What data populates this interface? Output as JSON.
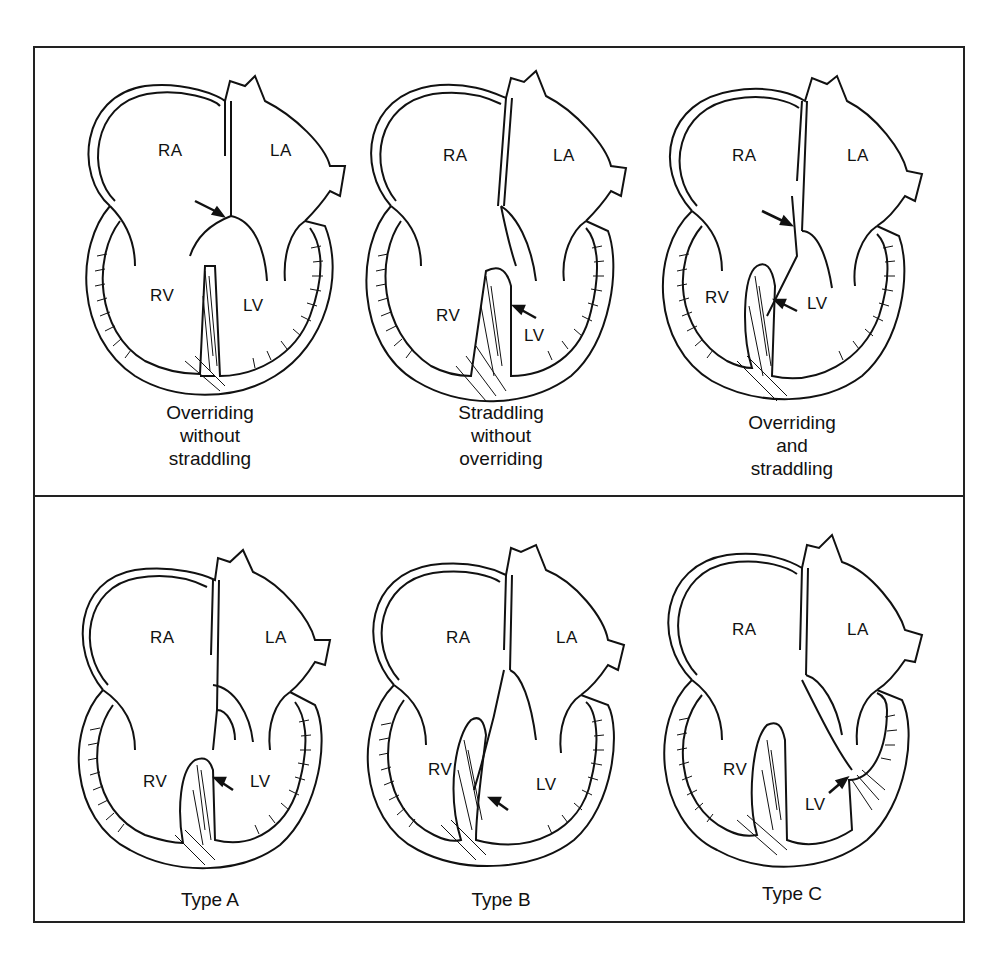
{
  "figure": {
    "rows": [
      {
        "panels": [
          {
            "caption": "Overriding\nwithout\nstraddling",
            "labels": {
              "ra": "RA",
              "la": "LA",
              "rv": "RV",
              "lv": "LV"
            },
            "arrows": 1,
            "arrow_targets": [
              "atrial septum / valve annulus overriding"
            ]
          },
          {
            "caption": "Straddling\nwithout\noverriding",
            "labels": {
              "ra": "RA",
              "la": "LA",
              "rv": "RV",
              "lv": "LV"
            },
            "arrows": 1,
            "arrow_targets": [
              "chordae straddling septal crest"
            ]
          },
          {
            "caption": "Overriding\nand\nstraddling",
            "labels": {
              "ra": "RA",
              "la": "LA",
              "rv": "RV",
              "lv": "LV"
            },
            "arrows": 2,
            "arrow_targets": [
              "overriding annulus",
              "straddling chordae"
            ]
          }
        ]
      },
      {
        "panels": [
          {
            "caption": "Type A",
            "labels": {
              "ra": "RA",
              "la": "LA",
              "rv": "RV",
              "lv": "LV"
            },
            "arrows": 1,
            "arrow_targets": [
              "chordae insertion near septal crest"
            ]
          },
          {
            "caption": "Type B",
            "labels": {
              "ra": "RA",
              "la": "LA",
              "rv": "RV",
              "lv": "LV"
            },
            "arrows": 1,
            "arrow_targets": [
              "chordae insertion along septum"
            ]
          },
          {
            "caption": "Type C",
            "labels": {
              "ra": "RA",
              "la": "LA",
              "rv": "RV",
              "lv": "LV"
            },
            "arrows": 1,
            "arrow_targets": [
              "chordae insertion on ventricular free wall"
            ]
          }
        ]
      }
    ],
    "colors": {
      "ink": "#111111",
      "background": "#ffffff",
      "frame": "#222222"
    }
  }
}
